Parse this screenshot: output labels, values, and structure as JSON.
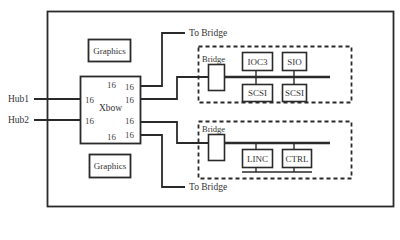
{
  "diagram": {
    "type": "block-diagram",
    "colors": {
      "line": "#2a2a2a",
      "background": "#ffffff"
    },
    "external_inputs": [
      {
        "id": "hub1",
        "label": "Hub1"
      },
      {
        "id": "hub2",
        "label": "Hub2"
      }
    ],
    "crossbar": {
      "label": "Xbow",
      "ports": {
        "top_left": "16",
        "top_right": "16",
        "upper_right": "16",
        "left_upper": "16",
        "left_lower": "16",
        "lower_right": "16",
        "bottom_left": "16",
        "bottom_right": "16"
      }
    },
    "graphics": [
      {
        "id": "graphics-top",
        "label": "Graphics"
      },
      {
        "id": "graphics-bottom",
        "label": "Graphics"
      }
    ],
    "to_bridge": [
      {
        "id": "to-bridge-top",
        "label": "To Bridge"
      },
      {
        "id": "to-bridge-bottom",
        "label": "To Bridge"
      }
    ],
    "io_groups": [
      {
        "id": "upper-io",
        "bridge_label": "Bridge",
        "devices_top": [
          "IOC3",
          "SIO"
        ],
        "devices_bottom": [
          "SCSI",
          "SCSI"
        ]
      },
      {
        "id": "lower-io",
        "bridge_label": "Bridge",
        "devices": [
          "LINC",
          "CTRL"
        ]
      }
    ]
  }
}
